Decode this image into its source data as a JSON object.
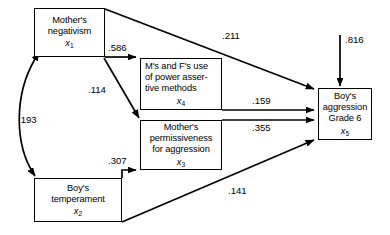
{
  "diagram": {
    "type": "path-diagram",
    "nodes": [
      {
        "id": "x1",
        "label": "Mother's\nnegativism",
        "var": "x",
        "sub": "1"
      },
      {
        "id": "x4",
        "label": "M's and F's use\nof power asser-\ntive methods",
        "var": "x",
        "sub": "4"
      },
      {
        "id": "x3",
        "label": "Mother's\npermissiveness\nfor aggression",
        "var": "x",
        "sub": "3"
      },
      {
        "id": "x2",
        "label": "Boy's\ntemperament",
        "var": "x",
        "sub": "2"
      },
      {
        "id": "x5",
        "label": "Boy's\naggression\nGrade 6",
        "var": "x",
        "sub": "5"
      }
    ],
    "paths": [
      {
        "id": "x1-x4",
        "from": "x1",
        "to": "x4",
        "coefficient": ".586",
        "kind": "directed"
      },
      {
        "id": "x1-x5",
        "from": "x1",
        "to": "x5",
        "coefficient": ".211",
        "kind": "directed"
      },
      {
        "id": "x1-x3",
        "from": "x1",
        "to": "x3",
        "coefficient": ".114",
        "kind": "directed"
      },
      {
        "id": "x1-x2",
        "from": "x1",
        "to": "x2",
        "coefficient": ".193",
        "kind": "correlation"
      },
      {
        "id": "x2-x3",
        "from": "x2",
        "to": "x3",
        "coefficient": ".307",
        "kind": "directed"
      },
      {
        "id": "x2-x5",
        "from": "x2",
        "to": "x5",
        "coefficient": ".141",
        "kind": "directed"
      },
      {
        "id": "x4-x5",
        "from": "x4",
        "to": "x5",
        "coefficient": ".159",
        "kind": "directed"
      },
      {
        "id": "x3-x5",
        "from": "x3",
        "to": "x5",
        "coefficient": ".355",
        "kind": "directed"
      },
      {
        "id": "dist-x5",
        "from": "disturbance",
        "to": "x5",
        "coefficient": ".816",
        "kind": "disturbance"
      }
    ],
    "colors": {
      "stroke": "#000000",
      "background": "#ffffff",
      "text": "#000000"
    }
  }
}
